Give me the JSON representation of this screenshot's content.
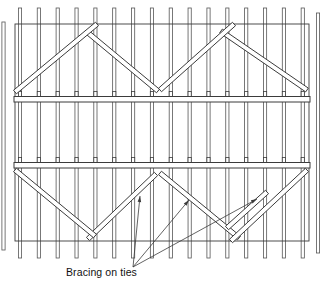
{
  "figure": {
    "label": "Bracing on ties"
  },
  "colors": {
    "line": "#3b3b3b",
    "line_soft": "#565656",
    "fill": "#ffffff",
    "text": "#111111",
    "background": "#ffffff"
  },
  "diagram": {
    "width": 323,
    "height": 284,
    "studs": {
      "count": 16,
      "x_start": 20,
      "x_step": 18.85,
      "y_top": 8,
      "y_bottom": 258,
      "bar_width": 3.2
    },
    "partial_studs": [
      {
        "x": 3.5,
        "y_top": 22,
        "y_bottom": 250
      },
      {
        "x": 318,
        "y_top": 13,
        "y_bottom": 253
      }
    ],
    "frame": {
      "x": 15,
      "y": 24,
      "width": 294,
      "height": 217
    },
    "ties": [
      {
        "x": 14,
        "y": 96.5,
        "width": 296,
        "height": 5.5
      },
      {
        "x": 14,
        "y": 162.5,
        "width": 296,
        "height": 5.5
      }
    ],
    "tie_tick": {
      "height": 5,
      "width": 3.2
    },
    "brace_width": 4.6,
    "braces": [
      {
        "name": "top-mid-falling-brace",
        "x1": 87,
        "y1": 32,
        "x2": 158,
        "y2": 91
      },
      {
        "name": "top-left-rising-brace",
        "x1": 15,
        "y1": 92,
        "x2": 97,
        "y2": 24
      },
      {
        "name": "top-right-falling-brace",
        "x1": 221,
        "y1": 31,
        "x2": 307,
        "y2": 90
      },
      {
        "name": "top-mid-rising-brace",
        "x1": 160,
        "y1": 90,
        "x2": 234,
        "y2": 24
      },
      {
        "name": "bottom-left-rising-brace",
        "x1": 88,
        "y1": 239,
        "x2": 156,
        "y2": 174
      },
      {
        "name": "bottom-left-falling-brace",
        "x1": 15,
        "y1": 170,
        "x2": 95,
        "y2": 236
      },
      {
        "name": "bottom-mid-falling-brace",
        "x1": 160,
        "y1": 173,
        "x2": 239,
        "y2": 238
      },
      {
        "name": "bottom-right-rising-brace",
        "x1": 231,
        "y1": 241,
        "x2": 307,
        "y2": 170
      },
      {
        "name": "bottom-short-lap-brace",
        "x1": 227,
        "y1": 228,
        "x2": 267,
        "y2": 192
      }
    ],
    "leaders": {
      "origin": {
        "x": 133,
        "y": 267
      },
      "targets": [
        {
          "x": 140,
          "y": 196
        },
        {
          "x": 189,
          "y": 200
        },
        {
          "x": 257,
          "y": 199
        }
      ]
    }
  }
}
